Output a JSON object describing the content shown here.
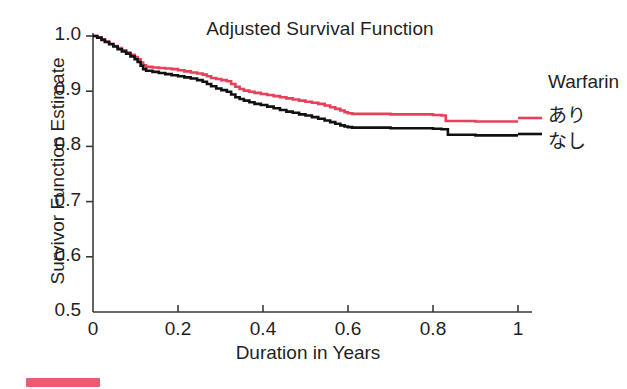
{
  "chart_data": {
    "type": "line",
    "subtype": "kaplan-meier-step",
    "title": "Adjusted Survival Function",
    "xlabel": "Duration in Years",
    "ylabel": "Survivor Function Estimate",
    "xlim": [
      0,
      1.05
    ],
    "ylim": [
      0.5,
      1.0
    ],
    "xticks": [
      0,
      0.2,
      0.4,
      0.6,
      0.8,
      1
    ],
    "xtick_labels": [
      "0",
      "0.2",
      "0.4",
      "0.6",
      "0.8",
      "1"
    ],
    "yticks": [
      0.5,
      0.6,
      0.7,
      0.8,
      0.9,
      1.0
    ],
    "ytick_labels": [
      "0.5",
      "0.6",
      "0.7",
      "0.8",
      "0.9",
      "1.0"
    ],
    "grid": false,
    "legend_position": "right",
    "legend_title": "Warfarin",
    "series": [
      {
        "name": "あり",
        "color": "#e8405a",
        "final_value": 0.845,
        "x": [
          0.0,
          0.01,
          0.02,
          0.028,
          0.038,
          0.048,
          0.058,
          0.068,
          0.078,
          0.088,
          0.098,
          0.105,
          0.112,
          0.118,
          0.125,
          0.14,
          0.155,
          0.17,
          0.185,
          0.2,
          0.215,
          0.23,
          0.245,
          0.258,
          0.268,
          0.278,
          0.29,
          0.302,
          0.315,
          0.325,
          0.335,
          0.345,
          0.355,
          0.368,
          0.38,
          0.395,
          0.41,
          0.425,
          0.44,
          0.455,
          0.47,
          0.485,
          0.5,
          0.515,
          0.53,
          0.545,
          0.558,
          0.57,
          0.582,
          0.592,
          0.6,
          0.61,
          0.7,
          0.8,
          0.82,
          0.83,
          0.9,
          1.0
        ],
        "y": [
          1.0,
          0.997,
          0.994,
          0.99,
          0.986,
          0.982,
          0.978,
          0.974,
          0.97,
          0.966,
          0.962,
          0.958,
          0.952,
          0.947,
          0.944,
          0.943,
          0.942,
          0.941,
          0.94,
          0.938,
          0.936,
          0.934,
          0.932,
          0.93,
          0.927,
          0.924,
          0.922,
          0.92,
          0.918,
          0.913,
          0.908,
          0.904,
          0.901,
          0.899,
          0.897,
          0.895,
          0.893,
          0.891,
          0.889,
          0.887,
          0.885,
          0.883,
          0.881,
          0.879,
          0.877,
          0.874,
          0.871,
          0.868,
          0.865,
          0.862,
          0.86,
          0.859,
          0.858,
          0.857,
          0.856,
          0.846,
          0.845,
          0.845
        ]
      },
      {
        "name": "なし",
        "color": "#111111",
        "final_value": 0.82,
        "x": [
          0.0,
          0.01,
          0.02,
          0.028,
          0.038,
          0.048,
          0.058,
          0.068,
          0.078,
          0.088,
          0.098,
          0.105,
          0.112,
          0.118,
          0.125,
          0.14,
          0.155,
          0.17,
          0.185,
          0.2,
          0.215,
          0.23,
          0.245,
          0.258,
          0.268,
          0.278,
          0.29,
          0.302,
          0.315,
          0.325,
          0.335,
          0.345,
          0.355,
          0.368,
          0.38,
          0.395,
          0.41,
          0.425,
          0.44,
          0.455,
          0.47,
          0.485,
          0.5,
          0.515,
          0.53,
          0.545,
          0.558,
          0.57,
          0.582,
          0.592,
          0.6,
          0.61,
          0.7,
          0.8,
          0.82,
          0.835,
          0.9,
          1.0
        ],
        "y": [
          1.0,
          0.997,
          0.993,
          0.989,
          0.985,
          0.981,
          0.976,
          0.972,
          0.968,
          0.963,
          0.958,
          0.953,
          0.946,
          0.94,
          0.937,
          0.935,
          0.933,
          0.931,
          0.929,
          0.927,
          0.925,
          0.923,
          0.92,
          0.917,
          0.913,
          0.909,
          0.905,
          0.902,
          0.899,
          0.894,
          0.889,
          0.886,
          0.883,
          0.88,
          0.877,
          0.875,
          0.872,
          0.869,
          0.866,
          0.863,
          0.861,
          0.858,
          0.856,
          0.853,
          0.85,
          0.847,
          0.844,
          0.841,
          0.838,
          0.836,
          0.835,
          0.834,
          0.833,
          0.832,
          0.831,
          0.821,
          0.82,
          0.82
        ]
      }
    ]
  },
  "legend": {
    "title": "Warfarin",
    "entries": [
      {
        "label": "あり",
        "color": "#e8405a"
      },
      {
        "label": "なし",
        "color": "#111111"
      }
    ]
  },
  "caption": {
    "text": ""
  },
  "colors": {
    "axis": "#3a3a3a",
    "text": "#1f1f1f",
    "background": "#ffffff",
    "series_red": "#e8405a",
    "series_black": "#111111"
  }
}
